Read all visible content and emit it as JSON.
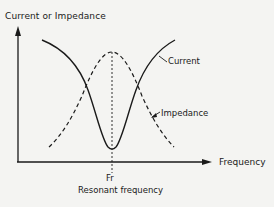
{
  "diagram": {
    "y_axis_label": "Current or Impedance",
    "x_axis_label": "Frequency",
    "curves": [
      {
        "name": "Current",
        "style": "solid",
        "shape": "valley",
        "minimum_at": "Fr"
      },
      {
        "name": "Impedance",
        "style": "dashed",
        "shape": "peak",
        "maximum_at": "Fr"
      }
    ],
    "marker": {
      "symbol": "Fr",
      "description": "Resonant frequency",
      "style": "dotted vertical line"
    },
    "labels": {
      "current": "Current",
      "impedance": "Impedance",
      "fr": "Fr",
      "resonant": "Resonant frequency"
    },
    "colors": {
      "ink": "#1a1a1a",
      "background": "#f4f4f2"
    }
  }
}
